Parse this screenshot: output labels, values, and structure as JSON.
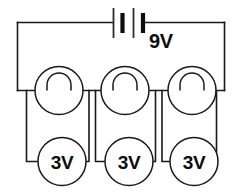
{
  "diagram": {
    "stroke_color": "#1a1a1a",
    "background_color": "#ffffff"
  },
  "battery": {
    "label": "9V",
    "symbol": "battery-two-cell",
    "plates": [
      "thin",
      "thick",
      "thin",
      "thick"
    ]
  },
  "lamps": [
    {
      "id": "lamp-left",
      "symbol": "lamp-filament"
    },
    {
      "id": "lamp-middle",
      "symbol": "lamp-filament"
    },
    {
      "id": "lamp-right",
      "symbol": "lamp-filament"
    }
  ],
  "voltmeters": [
    {
      "id": "voltmeter-left",
      "label": "3V"
    },
    {
      "id": "voltmeter-middle",
      "label": "3V"
    },
    {
      "id": "voltmeter-right",
      "label": "3V"
    }
  ]
}
